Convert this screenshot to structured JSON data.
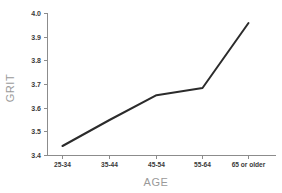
{
  "chart_data": {
    "type": "line",
    "title": "",
    "xlabel": "AGE",
    "ylabel": "GRIT",
    "categories": [
      "25-34",
      "35-44",
      "45-54",
      "55-64",
      "65 or older"
    ],
    "values": [
      3.44,
      3.55,
      3.655,
      3.685,
      3.96
    ],
    "series": [
      {
        "name": "GRIT",
        "values": [
          3.44,
          3.55,
          3.655,
          3.685,
          3.96
        ]
      }
    ],
    "ylim": [
      3.4,
      4.0
    ],
    "yticks": [
      "3.4",
      "3.5",
      "3.6",
      "3.7",
      "3.8",
      "3.9",
      "4.0"
    ],
    "ytick_values": [
      3.4,
      3.5,
      3.6,
      3.7,
      3.8,
      3.9,
      4.0
    ],
    "grid": false,
    "legend": false,
    "legend_position": "none",
    "line_color": "#2b2b2b",
    "axis_color": "#8c8c8c",
    "label_color": "#9a9a9a",
    "tick_color": "#3a3a3a",
    "background_color": "#ffffff"
  }
}
